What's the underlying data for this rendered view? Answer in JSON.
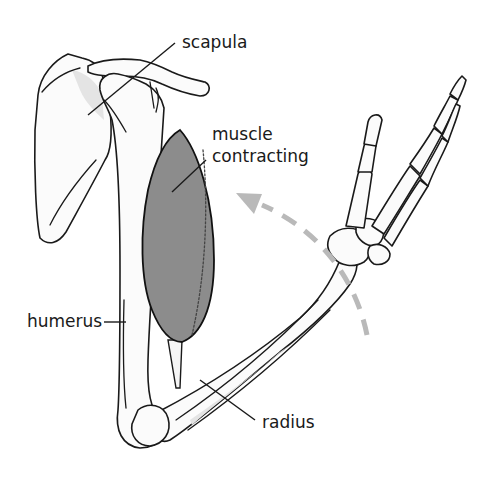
{
  "diagram": {
    "colors": {
      "bone_fill": "#fbfbfb",
      "bone_outline": "#1a1a1a",
      "muscle_fill": "#8c8c8c",
      "motion_arrow": "#b9b9b9"
    },
    "labels": {
      "scapula": "scapula",
      "muscle_line1": "muscle",
      "muscle_line2": "contracting",
      "humerus": "humerus",
      "radius": "radius"
    },
    "motion_arrow": {
      "style": "dashed",
      "direction": "counter-clockwise upward (forearm flexing)"
    }
  }
}
